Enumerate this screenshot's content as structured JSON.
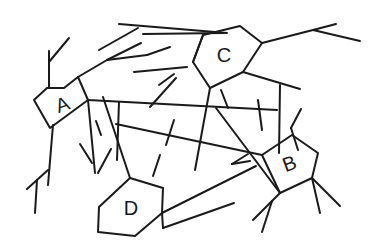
{
  "diagram": {
    "type": "network-of-polygons",
    "stroke_color": "#1a1a1a",
    "background": "#ffffff",
    "nodes": [
      {
        "id": "A",
        "label": "A",
        "label_pos": [
          63,
          106
        ],
        "label_rotate": -20,
        "points": [
          [
            34,
            100
          ],
          [
            47,
            88
          ],
          [
            64,
            88
          ],
          [
            78,
            77
          ],
          [
            88,
            100
          ],
          [
            50,
            128
          ]
        ]
      },
      {
        "id": "C",
        "label": "C",
        "label_pos": [
          224,
          57
        ],
        "label_rotate": 0,
        "points": [
          [
            203,
            35
          ],
          [
            240,
            26
          ],
          [
            262,
            43
          ],
          [
            243,
            72
          ],
          [
            210,
            88
          ],
          [
            193,
            62
          ]
        ]
      },
      {
        "id": "B",
        "label": "B",
        "label_pos": [
          290,
          165
        ],
        "label_rotate": -20,
        "points": [
          [
            262,
            155
          ],
          [
            292,
            135
          ],
          [
            318,
            153
          ],
          [
            312,
            178
          ],
          [
            280,
            193
          ]
        ]
      },
      {
        "id": "D",
        "label": "D",
        "label_pos": [
          131,
          210
        ],
        "label_rotate": 0,
        "points": [
          [
            130,
            178
          ],
          [
            163,
            188
          ],
          [
            162,
            213
          ],
          [
            135,
            236
          ],
          [
            98,
            232
          ],
          [
            99,
            207
          ]
        ]
      }
    ],
    "lines": [
      [
        119,
        24,
        227,
        33
      ],
      [
        138,
        28,
        99,
        50
      ],
      [
        78,
        77,
        107,
        60
      ],
      [
        107,
        60,
        141,
        43
      ],
      [
        107,
        60,
        147,
        55
      ],
      [
        49,
        88,
        49,
        51
      ],
      [
        49,
        62,
        69,
        38
      ],
      [
        88,
        100,
        277,
        110
      ],
      [
        134,
        72,
        187,
        67
      ],
      [
        150,
        107,
        176,
        78
      ],
      [
        159,
        85,
        174,
        74
      ],
      [
        203,
        35,
        193,
        62
      ],
      [
        262,
        43,
        313,
        30
      ],
      [
        313,
        30,
        360,
        41
      ],
      [
        313,
        30,
        336,
        24
      ],
      [
        243,
        72,
        300,
        89
      ],
      [
        280,
        85,
        279,
        153
      ],
      [
        210,
        88,
        195,
        170
      ],
      [
        298,
        150,
        291,
        128
      ],
      [
        291,
        128,
        301,
        109
      ],
      [
        88,
        100,
        95,
        173
      ],
      [
        98,
        173,
        111,
        149
      ],
      [
        92,
        163,
        80,
        144
      ],
      [
        103,
        97,
        130,
        178
      ],
      [
        119,
        102,
        117,
        160
      ],
      [
        116,
        124,
        262,
        155
      ],
      [
        153,
        176,
        160,
        155
      ],
      [
        53,
        125,
        48,
        185
      ],
      [
        48,
        170,
        27,
        189
      ],
      [
        37,
        180,
        35,
        213
      ],
      [
        216,
        108,
        280,
        193
      ],
      [
        162,
        213,
        256,
        166
      ],
      [
        232,
        164,
        248,
        154
      ],
      [
        232,
        164,
        250,
        161
      ],
      [
        163,
        228,
        234,
        203
      ],
      [
        162,
        213,
        163,
        228
      ],
      [
        272,
        201,
        253,
        220
      ],
      [
        272,
        201,
        262,
        232
      ],
      [
        280,
        193,
        272,
        201
      ],
      [
        312,
        178,
        340,
        206
      ],
      [
        312,
        178,
        320,
        213
      ],
      [
        143,
        34,
        224,
        33
      ],
      [
        147,
        55,
        170,
        47
      ],
      [
        221,
        90,
        228,
        108
      ],
      [
        174,
        120,
        166,
        145
      ],
      [
        96,
        121,
        101,
        135
      ],
      [
        258,
        100,
        262,
        130
      ]
    ]
  }
}
